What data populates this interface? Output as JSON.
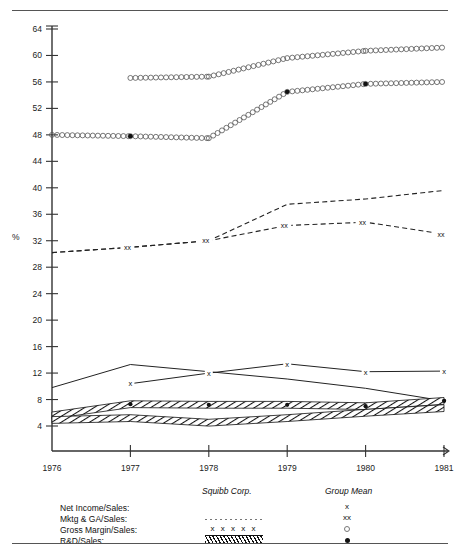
{
  "figure": {
    "top_rule": true,
    "bottom_rule": true,
    "ghost_title": ""
  },
  "axis": {
    "y_unit": "%",
    "y_ticks": [
      4,
      8,
      12,
      16,
      20,
      24,
      28,
      32,
      36,
      40,
      44,
      48,
      52,
      56,
      60,
      64
    ],
    "x_ticks": [
      "1976",
      "1977",
      "1978",
      "1979",
      "1980",
      "1981"
    ]
  },
  "legend": {
    "col_company": "Squibb Corp.",
    "col_group": "Group Mean",
    "rows": [
      {
        "label": "Net Income/Sales:",
        "company_symbol": "solid-line",
        "group_symbol": "x"
      },
      {
        "label": "Mktg & GA/Sales:",
        "company_symbol": "dotted-line",
        "group_symbol": "xx"
      },
      {
        "label": "Gross Margin/Sales:",
        "company_symbol": "x x x x x",
        "group_symbol": "o"
      },
      {
        "label": "R&D/Sales:",
        "company_symbol": "hatched-band",
        "group_symbol": "dot"
      }
    ]
  },
  "chart_data": {
    "type": "line",
    "title": "",
    "xlabel": "",
    "ylabel": "%",
    "xlim": [
      1976,
      1981
    ],
    "ylim": [
      0,
      64
    ],
    "grid": false,
    "legend_position": "bottom",
    "x": [
      1976,
      1977,
      1978,
      1979,
      1980,
      1981
    ],
    "series": [
      {
        "name": "Gross Margin/Sales - Group Mean",
        "style": "o-chain",
        "x": [
          1977,
          1978,
          1979,
          1980,
          1981
        ],
        "values": [
          56.6,
          56.8,
          59.6,
          60.7,
          61.2
        ]
      },
      {
        "name": "Gross Margin/Sales - Squibb Corp.",
        "style": "x-chain",
        "x": [
          1976,
          1977,
          1978,
          1979,
          1980,
          1981
        ],
        "values": [
          48.0,
          47.8,
          47.5,
          54.5,
          55.7,
          56.0
        ]
      },
      {
        "name": "Mktg & GA/Sales - Squibb Corp.",
        "style": "dashed",
        "x": [
          1976,
          1977,
          1978,
          1979,
          1980,
          1981
        ],
        "values": [
          30.2,
          31.0,
          32.0,
          37.5,
          38.3,
          39.6
        ]
      },
      {
        "name": "Mktg & GA/Sales - Group Mean",
        "style": "dashed-xx",
        "x": [
          1976,
          1977,
          1978,
          1979,
          1980,
          1981
        ],
        "values": [
          30.2,
          31.0,
          32.0,
          34.3,
          34.8,
          33.0
        ]
      },
      {
        "name": "Net Income/Sales - Squibb Corp.",
        "style": "solid",
        "x": [
          1976,
          1977,
          1978,
          1979,
          1980,
          1981
        ],
        "values": [
          9.8,
          13.3,
          12.2,
          11.1,
          9.7,
          7.8
        ]
      },
      {
        "name": "Net Income/Sales - Group Mean",
        "style": "solid-x",
        "x": [
          1977,
          1978,
          1979,
          1980,
          1981
        ],
        "values": [
          10.4,
          12.0,
          13.4,
          12.2,
          12.3
        ]
      },
      {
        "name": "R&D/Sales - Squibb Corp. (band upper)",
        "style": "hatch-band",
        "x": [
          1976,
          1977,
          1978,
          1979,
          1980,
          1981
        ],
        "values": [
          5.6,
          7.3,
          7.2,
          7.2,
          7.0,
          7.8
        ]
      },
      {
        "name": "R&D/Sales - Group Mean (band lower)",
        "style": "hatch-band",
        "x": [
          1976,
          1977,
          1978,
          1979,
          1980,
          1981
        ],
        "values": [
          4.9,
          5.2,
          4.5,
          5.2,
          6.0,
          6.7
        ]
      },
      {
        "name": "R&D/Sales - Group Mean markers",
        "style": "dot",
        "x": [
          1977,
          1978,
          1979,
          1980,
          1981
        ],
        "values": [
          7.3,
          7.2,
          7.2,
          7.0,
          7.8
        ]
      },
      {
        "name": "Gross Margin/Sales markers (filled)",
        "style": "dot",
        "x": [
          1977,
          1979,
          1980
        ],
        "values": [
          47.8,
          54.5,
          55.7
        ]
      }
    ]
  }
}
